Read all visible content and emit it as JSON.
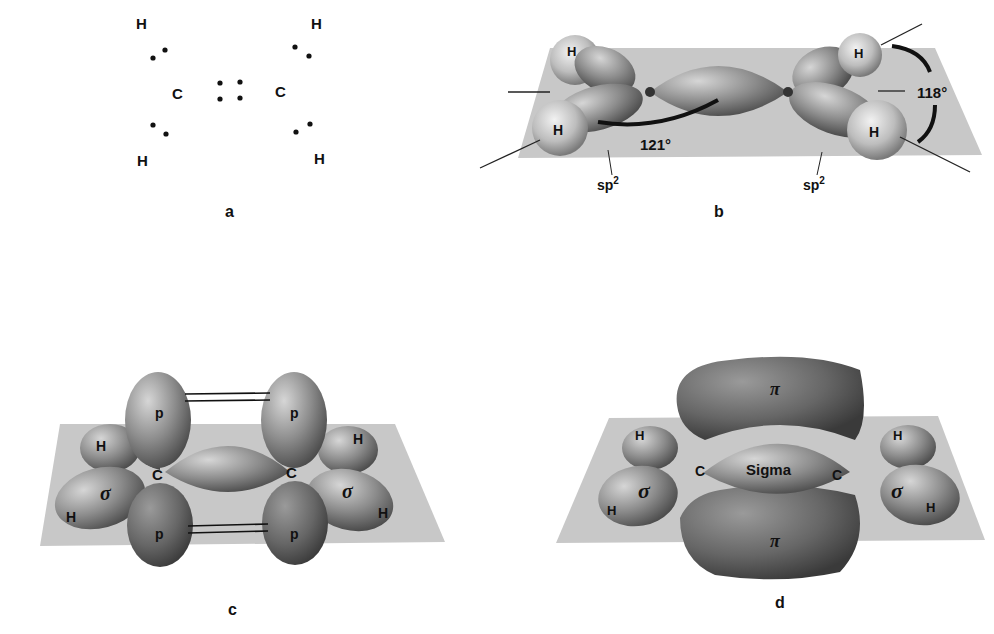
{
  "panels": {
    "a": {
      "caption": "a",
      "title": "Lewis structure of ethylene",
      "atoms": {
        "h_top_left": "H",
        "h_bottom_left": "H",
        "h_top_right": "H",
        "h_bottom_right": "H",
        "c_left": "C",
        "c_right": "C"
      }
    },
    "b": {
      "caption": "b",
      "atoms": {
        "h1": "H",
        "h2": "H",
        "h3": "H",
        "h4": "H"
      },
      "angle_hch": "118°",
      "angle_hcc": "121°",
      "hybrid_left": "sp",
      "hybrid_right": "sp",
      "hybrid_sup": "2"
    },
    "c": {
      "caption": "c",
      "p_label": "p",
      "sigma": "σ",
      "h": "H",
      "c": "C"
    },
    "d": {
      "caption": "d",
      "pi": "π",
      "sigma": "σ",
      "sigma_bond": "Sigma",
      "h": "H",
      "c": "C"
    }
  },
  "colors": {
    "plane": "#c8c8c8",
    "lobe_dark": "#555555",
    "lobe_mid": "#8a8a8a",
    "lobe_light": "#d8d8d8",
    "text": "#111111"
  }
}
